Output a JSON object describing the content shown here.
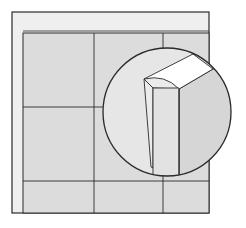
{
  "diagram": {
    "kind": "tile-edge-trim-detail-illustration",
    "colors": {
      "background": "#ffffff",
      "frame_band": "#efefef",
      "tile_fill": "#dcdcdc",
      "stroke": "#2a2a2a",
      "detail_bg": "#e6e6e6",
      "trim_top": "#ffffff",
      "trim_side": "#d6d6d6",
      "trim_flap": "#ebebeb"
    },
    "frame": {
      "x": 12,
      "y": 12,
      "width": 197,
      "height": 201
    },
    "panel": {
      "x": 23,
      "y": 33,
      "width": 186,
      "height": 180
    },
    "grid": {
      "vertical_lines_x": [
        94,
        163
      ],
      "horizontal_lines_y": [
        107,
        181
      ]
    },
    "detail_callout": {
      "shape": "circle",
      "cx": 167,
      "cy": 112,
      "r": 64,
      "subject": "L-shaped edge trim profile wrapping tile edge"
    }
  }
}
